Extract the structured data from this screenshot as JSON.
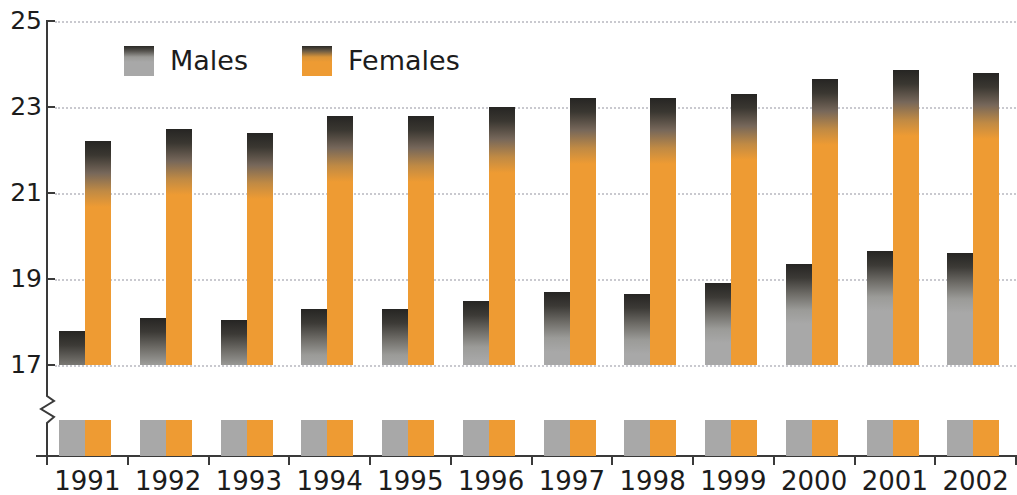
{
  "chart_data": {
    "type": "bar",
    "title": "",
    "subtitle": "",
    "xlabel": "",
    "ylabel": "",
    "categories": [
      "1991",
      "1992",
      "1993",
      "1994",
      "1995",
      "1996",
      "1997",
      "1998",
      "1999",
      "2000",
      "2001",
      "2002"
    ],
    "series": [
      {
        "name": "Males",
        "color": "#a8a8a8",
        "values": [
          17.8,
          18.1,
          18.05,
          18.3,
          18.3,
          18.5,
          18.7,
          18.65,
          18.9,
          19.35,
          19.65,
          19.6
        ]
      },
      {
        "name": "Females",
        "color": "#ee9b33",
        "values": [
          22.2,
          22.5,
          22.4,
          22.8,
          22.8,
          23.0,
          23.2,
          23.2,
          23.3,
          23.65,
          23.85,
          23.8
        ]
      }
    ],
    "ylim": [
      17,
      25
    ],
    "yticks": [
      17,
      19,
      21,
      23,
      25
    ],
    "ytick_labels": [
      "17",
      "19",
      "21",
      "23",
      "25"
    ],
    "axis_broken": true,
    "axis_break_note": "y-axis is broken below 17",
    "grid": "horizontal-dotted",
    "legend_position": "top-left"
  },
  "legend": {
    "items": [
      {
        "label": "Males",
        "swatch": "male"
      },
      {
        "label": "Females",
        "swatch": "female"
      }
    ]
  },
  "axis": {
    "y_labels": [
      "25",
      "23",
      "21",
      "19",
      "17"
    ],
    "x_labels": [
      "1991",
      "1992",
      "1993",
      "1994",
      "1995",
      "1996",
      "1997",
      "1998",
      "1999",
      "2000",
      "2001",
      "2002"
    ]
  },
  "colors": {
    "male": "#a8a8a8",
    "female": "#ee9b33",
    "bar_top_shade": "#262523",
    "axis": "#3a3a3a",
    "grid": "#c9c9cf",
    "text": "#1c1c1c",
    "background": "#ffffff"
  }
}
